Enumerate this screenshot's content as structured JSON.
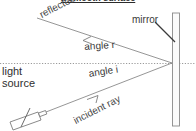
{
  "diagram": {
    "heading": "a smooth surface",
    "labels": {
      "reflected_ray": "reflected ray",
      "mirror": "mirror",
      "angle_r": "angle r",
      "angle_i": "angle i",
      "light_source_line1": "light",
      "light_source_line2": "source",
      "incident_ray": "incident ray"
    },
    "colors": {
      "line": "#777777",
      "text": "#3a3a3a",
      "heading": "#2b2b2b",
      "normal_dotted": "#9a9a9a",
      "mirror_fill": "#fbfbfb",
      "mirror_stroke": "#8a8a8a",
      "background": "#ffffff"
    },
    "geometry": {
      "incidence_point_x": 172,
      "incidence_point_y": 63,
      "normal_line_y": 63,
      "mirror_x": 176,
      "mirror_top_y": 13,
      "mirror_bottom_y": 126,
      "reflected_ray_start_x": 37,
      "reflected_ray_start_y": 18,
      "incident_ray_start_x": 46,
      "incident_ray_start_y": 112
    }
  }
}
